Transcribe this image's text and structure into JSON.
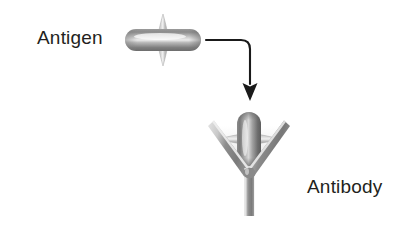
{
  "figure": {
    "type": "biology-diagram",
    "background_color": "#ffffff"
  },
  "labels": {
    "antigen": "Antigen",
    "antibody": "Antibody",
    "text_color": "#231f20"
  },
  "shapes": {
    "free_antigen": {
      "name": "free-antigen",
      "orientation": "horizontal-capsule-with-vertical-spindle",
      "center_x": 163,
      "center_y": 40,
      "capsule_width": 76,
      "capsule_height": 22,
      "spindle_length": 52,
      "spindle_width": 11,
      "body_color": "#8c8c8c",
      "highlight_color": "#e8e8e8",
      "shadow_color": "#6a6a6a",
      "spindle_color": "#bdbdbd"
    },
    "bound_antigen": {
      "name": "bound-antigen",
      "orientation": "vertical-capsule-with-horizontal-spindle",
      "center_x": 249,
      "center_y": 139,
      "capsule_width": 24,
      "capsule_height": 54,
      "spindle_length": 60,
      "spindle_width": 13,
      "body_color": "#7d7d7d",
      "highlight_color": "#d9d9d9",
      "shadow_color": "#555555",
      "spindle_color": "#c4c4c4"
    },
    "antibody": {
      "name": "antibody-y-shape",
      "apex_x": 249,
      "apex_y": 176,
      "left_arm_tip_x": 214,
      "left_arm_tip_y": 124,
      "right_arm_tip_x": 284,
      "right_arm_tip_y": 124,
      "stem_bottom_y": 216,
      "stroke_width": 9,
      "body_color": "#8f8f8f",
      "highlight_color": "#dcdcdc",
      "shadow_color": "#6e6e6e"
    },
    "arrow": {
      "name": "flow-arrow",
      "start_x": 206,
      "start_y": 40,
      "corner_x": 250,
      "corner_y": 40,
      "end_x": 250,
      "end_y": 101,
      "color": "#1a1a1a",
      "stroke_width": 2,
      "head_width": 15,
      "head_length": 17
    }
  }
}
